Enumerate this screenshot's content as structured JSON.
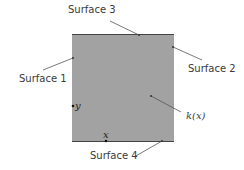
{
  "labels": {
    "surface1": "Surface 1",
    "surface2": "Surface 2",
    "surface3": "Surface 3",
    "surface4": "Surface 4",
    "conductivity": "k(x)",
    "x_axis": "x",
    "y_axis": "y"
  },
  "colors": {
    "fill": "#a2a2a2",
    "edge": "#444444",
    "text": "#3a3a3a"
  }
}
